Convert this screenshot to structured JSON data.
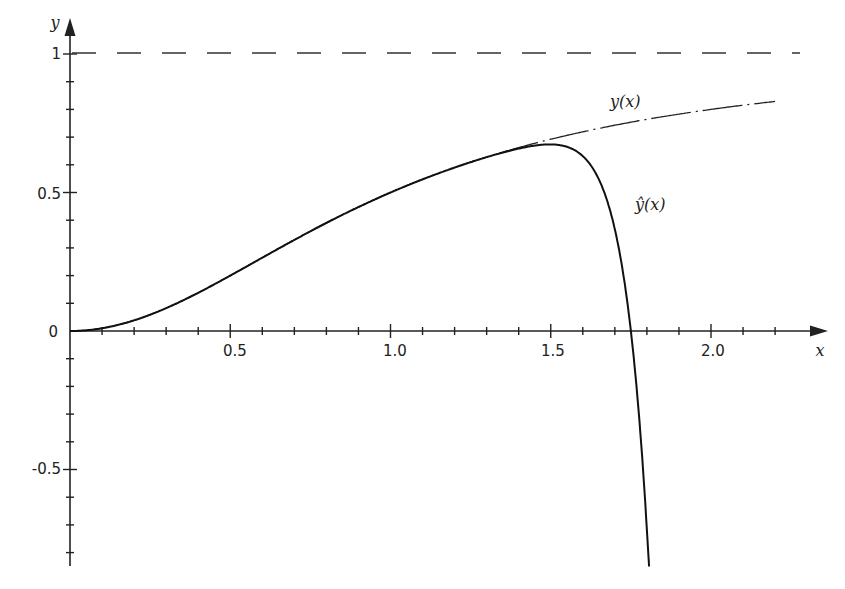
{
  "chart_data": {
    "type": "line",
    "title": "",
    "xlabel": "x",
    "ylabel": "y",
    "xlim": [
      0,
      2.2
    ],
    "ylim": [
      -0.85,
      1.05
    ],
    "grid": false,
    "x_ticks": [
      {
        "value": 0.5,
        "label": "0.5"
      },
      {
        "value": 1.0,
        "label": "1.0"
      },
      {
        "value": 1.5,
        "label": "1.5"
      },
      {
        "value": 2.0,
        "label": "2.0"
      }
    ],
    "x_minor_tick_step": 0.1,
    "y_ticks": [
      {
        "value": 1,
        "label": "1"
      },
      {
        "value": 0.5,
        "label": "0.5"
      },
      {
        "value": 0,
        "label": "0"
      },
      {
        "value": -0.5,
        "label": "-0.5"
      }
    ],
    "y_minor_tick_step": 0.1,
    "asymptote": {
      "y": 1,
      "style": "dashed"
    },
    "series": [
      {
        "name": "y(x)",
        "style": "dash-dot",
        "x": [
          0,
          0.25,
          0.5,
          0.75,
          1.0,
          1.25,
          1.5,
          1.75,
          2.0,
          2.2
        ],
        "values": [
          0,
          0.06,
          0.2,
          0.36,
          0.5,
          0.61,
          0.69,
          0.75,
          0.8,
          0.83
        ]
      },
      {
        "name": "ŷ(x)",
        "style": "solid",
        "x": [
          0,
          0.25,
          0.5,
          0.75,
          1.0,
          1.25,
          1.4,
          1.5,
          1.6,
          1.7,
          1.75,
          1.8
        ],
        "values": [
          0,
          0.06,
          0.2,
          0.36,
          0.5,
          0.61,
          0.63,
          0.62,
          0.5,
          0.2,
          0.0,
          -0.85
        ]
      }
    ],
    "annotations": [
      {
        "text": "y(x)",
        "near_x": 1.75,
        "near_y": 0.8
      },
      {
        "text": "ŷ(x)",
        "near_x": 1.75,
        "near_y": 0.48
      }
    ]
  },
  "labels": {
    "x_axis": "x",
    "y_axis": "y",
    "curve_y": "y(x)",
    "curve_yhat": "ŷ(x)",
    "x_tick_0_5": "0.5",
    "x_tick_1_0": "1.0",
    "x_tick_1_5": "1.5",
    "x_tick_2_0": "2.0",
    "y_tick_1": "1",
    "y_tick_0_5": "0.5",
    "y_tick_0": "0",
    "y_tick_m0_5": "-0.5"
  }
}
